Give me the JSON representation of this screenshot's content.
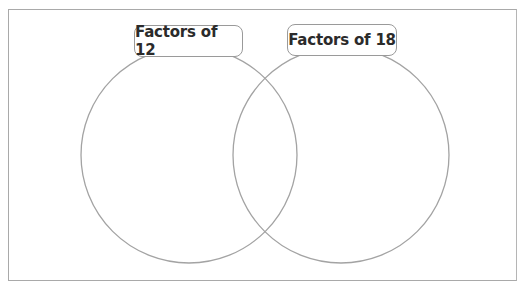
{
  "diagram": {
    "type": "venn",
    "sets": [
      {
        "label": "Factors of 12",
        "items": []
      },
      {
        "label": "Factors of 18",
        "items": []
      }
    ],
    "intersection_items": [],
    "colors": {
      "outline": "#a0a0a0",
      "text": "#2b2b2b",
      "background": "#ffffff"
    }
  }
}
